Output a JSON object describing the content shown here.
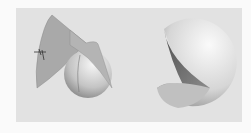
{
  "figure": {
    "panels": [
      {
        "name": "sphere-with-cone-wedge",
        "description": "Sphere intersected by a conical wedge with small axis marker"
      },
      {
        "name": "sphere-with-wedge-removed",
        "description": "Sphere with a wedge cut out revealing interior"
      }
    ],
    "colors": {
      "background": "#e2e2e2",
      "sphere_light": "#f4f4f4",
      "sphere_dark": "#8a8a8a",
      "wedge": "#a8a8a8",
      "cut_face_dark": "#5e5e5e"
    }
  }
}
